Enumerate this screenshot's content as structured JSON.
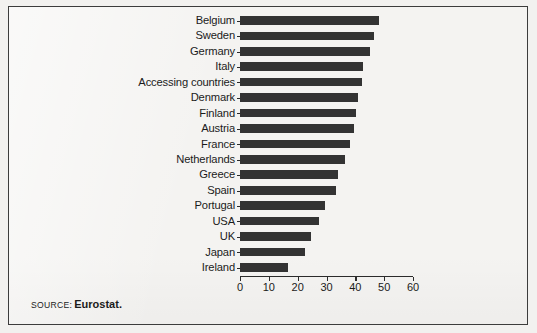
{
  "chart_data": {
    "type": "bar",
    "orientation": "horizontal",
    "title": "",
    "xlabel": "",
    "ylabel": "",
    "xlim": [
      0,
      60
    ],
    "xticks": [
      0,
      10,
      20,
      30,
      40,
      50,
      60
    ],
    "xtick_labels": [
      "0",
      "10",
      "20",
      "30",
      "40",
      "50",
      "60"
    ],
    "grid": false,
    "legend": null,
    "bar_color": "#333333",
    "categories": [
      "Belgium",
      "Sweden",
      "Germany",
      "Italy",
      "Accessing countries",
      "Denmark",
      "Finland",
      "Austria",
      "France",
      "Netherlands",
      "Greece",
      "Spain",
      "Portugal",
      "USA",
      "UK",
      "Japan",
      "Ireland"
    ],
    "values": [
      48.2,
      46.5,
      45.0,
      42.5,
      42.2,
      41.0,
      40.4,
      39.4,
      38.2,
      36.5,
      34.0,
      33.2,
      29.4,
      27.3,
      24.6,
      22.6,
      16.8
    ]
  },
  "source": {
    "label": "SOURCE:",
    "value": "Eurostat."
  }
}
